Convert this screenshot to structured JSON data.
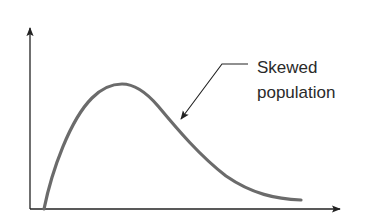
{
  "diagram": {
    "type": "skewed-distribution-curve",
    "annotation": {
      "line1": "Skewed",
      "line2": "population"
    },
    "colors": {
      "curve": "#6b6b6b",
      "axis": "#222222",
      "leader": "#222222",
      "text": "#2a2a2a",
      "background": "#ffffff"
    },
    "axes": {
      "x_label": "",
      "y_label": "",
      "ticks": false
    }
  }
}
